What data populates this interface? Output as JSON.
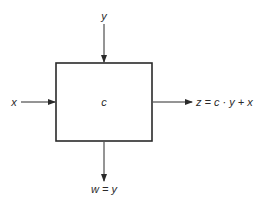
{
  "diagram": {
    "block": {
      "label": "c"
    },
    "inputs": {
      "top": {
        "label": "y"
      },
      "left": {
        "label": "x"
      }
    },
    "outputs": {
      "right": {
        "label": "z = c · y + x"
      },
      "bottom": {
        "label": "w = y"
      }
    },
    "colors": {
      "stroke": "#2a2a2a",
      "background": "#ffffff"
    }
  }
}
